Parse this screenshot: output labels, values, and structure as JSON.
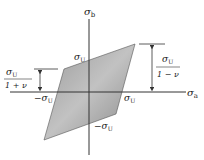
{
  "diagram": {
    "axes": {
      "x_label": "σ",
      "x_sub": "a",
      "y_label": "σ",
      "y_sub": "b"
    },
    "labels": {
      "top": {
        "sym": "σ",
        "sub": "U"
      },
      "right": {
        "sym": "σ",
        "sub": "U"
      },
      "left": {
        "sym": "−σ",
        "sub": "U"
      },
      "bottom": {
        "sym": "−σ",
        "sub": "U"
      },
      "left_fraction": {
        "num_sym": "σ",
        "num_sub": "U",
        "den": "1 + ν"
      },
      "right_fraction": {
        "num_sym": "σ",
        "num_sub": "U",
        "den": "1 − ν"
      }
    },
    "colors": {
      "region_fill": "#8e8e8e",
      "region_light": "#c4c4c4",
      "axis": "#333333"
    }
  }
}
